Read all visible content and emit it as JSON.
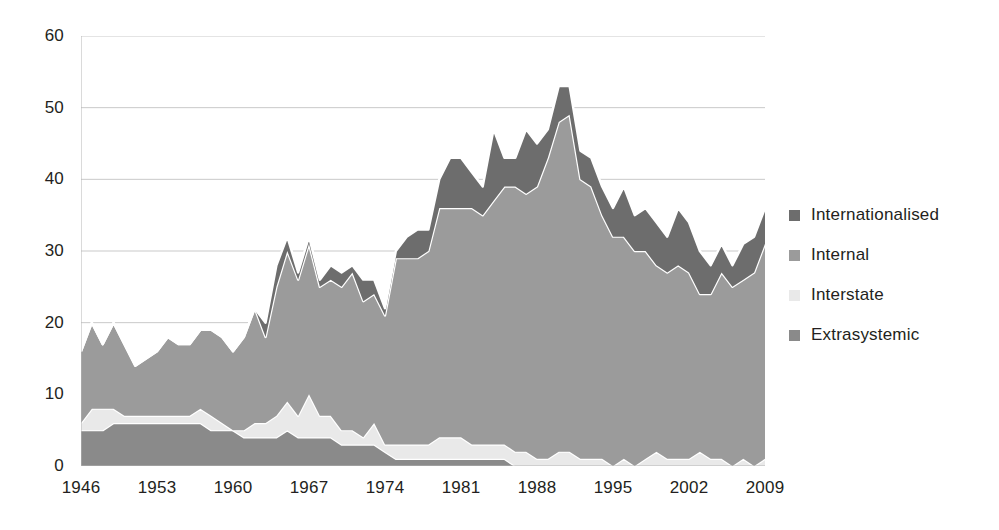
{
  "chart_data": {
    "type": "area",
    "stacked": true,
    "title": "",
    "subtitle": "",
    "xlabel": "",
    "ylabel": "",
    "xlim": [
      1946,
      2009
    ],
    "ylim": [
      0,
      60
    ],
    "ytick_step": 10,
    "xtick_step": 7,
    "grid": true,
    "grid_axis": "y",
    "legend_position": "right",
    "x": [
      1946,
      1947,
      1948,
      1949,
      1950,
      1951,
      1952,
      1953,
      1954,
      1955,
      1956,
      1957,
      1958,
      1959,
      1960,
      1961,
      1962,
      1963,
      1964,
      1965,
      1966,
      1967,
      1968,
      1969,
      1970,
      1971,
      1972,
      1973,
      1974,
      1975,
      1976,
      1977,
      1978,
      1979,
      1980,
      1981,
      1982,
      1983,
      1984,
      1985,
      1986,
      1987,
      1988,
      1989,
      1990,
      1991,
      1992,
      1993,
      1994,
      1995,
      1996,
      1997,
      1998,
      1999,
      2000,
      2001,
      2002,
      2003,
      2004,
      2005,
      2006,
      2007,
      2008,
      2009
    ],
    "ytick_labels": [
      "0",
      "10",
      "20",
      "30",
      "40",
      "50",
      "60"
    ],
    "ytick_values": [
      0,
      10,
      20,
      30,
      40,
      50,
      60
    ],
    "xtick_labels": [
      "1946",
      "1953",
      "1960",
      "1967",
      "1974",
      "1981",
      "1988",
      "1995",
      "2002",
      "2009"
    ],
    "xtick_values": [
      1946,
      1953,
      1960,
      1967,
      1974,
      1981,
      1988,
      1995,
      2002,
      2009
    ],
    "stack_order_bottom_to_top": [
      "Extrasystemic",
      "Interstate",
      "Internal",
      "Internationalised"
    ],
    "series": [
      {
        "name": "Extrasystemic",
        "color": "#8a8a8a",
        "values": [
          5,
          5,
          5,
          6,
          6,
          6,
          6,
          6,
          6,
          6,
          6,
          6,
          5,
          5,
          5,
          4,
          4,
          4,
          4,
          5,
          4,
          4,
          4,
          4,
          3,
          3,
          3,
          3,
          2,
          1,
          1,
          1,
          1,
          1,
          1,
          1,
          1,
          1,
          1,
          1,
          0,
          0,
          0,
          0,
          0,
          0,
          0,
          0,
          0,
          0,
          0,
          0,
          0,
          0,
          0,
          0,
          0,
          0,
          0,
          0,
          0,
          0,
          0,
          0
        ]
      },
      {
        "name": "Interstate",
        "color": "#e9e9e9",
        "values": [
          1,
          3,
          3,
          2,
          1,
          1,
          1,
          1,
          1,
          1,
          1,
          2,
          2,
          1,
          0,
          1,
          2,
          2,
          3,
          4,
          3,
          6,
          3,
          3,
          2,
          2,
          1,
          3,
          1,
          2,
          2,
          2,
          2,
          3,
          3,
          3,
          2,
          2,
          2,
          2,
          2,
          2,
          1,
          1,
          2,
          2,
          1,
          1,
          1,
          0,
          1,
          0,
          1,
          2,
          1,
          1,
          1,
          2,
          1,
          1,
          0,
          1,
          0,
          1
        ]
      },
      {
        "name": "Internal",
        "color": "#9b9b9b",
        "values": [
          10,
          12,
          9,
          12,
          10,
          7,
          8,
          9,
          11,
          10,
          10,
          11,
          12,
          12,
          11,
          13,
          16,
          12,
          18,
          21,
          19,
          21,
          18,
          19,
          20,
          22,
          19,
          18,
          18,
          26,
          26,
          26,
          27,
          32,
          32,
          32,
          33,
          32,
          34,
          36,
          37,
          36,
          38,
          42,
          46,
          47,
          39,
          38,
          34,
          32,
          31,
          30,
          29,
          26,
          26,
          27,
          26,
          22,
          23,
          26,
          25,
          25,
          27,
          30
        ]
      },
      {
        "name": "Internationalised",
        "color": "#6d6d6d",
        "values": [
          0,
          0,
          0,
          0,
          0,
          0,
          0,
          0,
          0,
          0,
          0,
          0,
          0,
          0,
          0,
          0,
          0,
          2,
          3,
          2,
          1,
          1,
          1,
          2,
          2,
          1,
          3,
          2,
          1,
          1,
          3,
          4,
          3,
          4,
          7,
          7,
          5,
          4,
          10,
          4,
          4,
          9,
          6,
          4,
          5,
          4,
          4,
          4,
          4,
          4,
          7,
          5,
          6,
          6,
          5,
          8,
          7,
          6,
          4,
          4,
          3,
          5,
          5,
          5
        ]
      }
    ],
    "totals": [
      16,
      20,
      17,
      20,
      17,
      14,
      15,
      16,
      18,
      17,
      17,
      19,
      19,
      18,
      16,
      18,
      22,
      20,
      28,
      32,
      27,
      32,
      26,
      28,
      27,
      28,
      26,
      26,
      22,
      30,
      32,
      33,
      33,
      40,
      43,
      43,
      41,
      39,
      47,
      43,
      43,
      47,
      45,
      47,
      53,
      53,
      44,
      43,
      39,
      36,
      39,
      35,
      36,
      34,
      32,
      36,
      34,
      30,
      28,
      31,
      28,
      31,
      32,
      36
    ]
  },
  "legend": {
    "items": [
      {
        "label": "Internationalised",
        "color": "#6d6d6d"
      },
      {
        "label": "Internal",
        "color": "#9b9b9b"
      },
      {
        "label": "Interstate",
        "color": "#e9e9e9"
      },
      {
        "label": "Extrasystemic",
        "color": "#8a8a8a"
      }
    ]
  },
  "axes": {
    "y_labels": [
      "60",
      "50",
      "40",
      "30",
      "20",
      "10",
      "0"
    ],
    "x_labels": [
      "1946",
      "1953",
      "1960",
      "1967",
      "1974",
      "1981",
      "1988",
      "1995",
      "2002",
      "2009"
    ]
  },
  "style": {
    "gridline_color": "#c9c9c9",
    "axis_color": "#b5b5b5",
    "separator_color": "#ffffff",
    "background": "#ffffff"
  }
}
